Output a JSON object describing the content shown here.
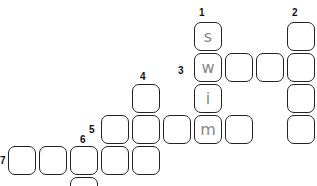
{
  "puzzle": {
    "numbers": [
      {
        "n": "1",
        "x": 199,
        "y": 7
      },
      {
        "n": "2",
        "x": 292,
        "y": 7
      },
      {
        "n": "3",
        "x": 178,
        "y": 65
      },
      {
        "n": "4",
        "x": 140,
        "y": 71
      },
      {
        "n": "5",
        "x": 89,
        "y": 124
      },
      {
        "n": "6",
        "x": 80,
        "y": 134
      },
      {
        "n": "7",
        "x": 0,
        "y": 155
      }
    ],
    "cells": [
      {
        "col": 6,
        "row": 0,
        "letter": "s"
      },
      {
        "col": 9,
        "row": 0,
        "letter": ""
      },
      {
        "col": 6,
        "row": 1,
        "letter": "w"
      },
      {
        "col": 7,
        "row": 1,
        "letter": ""
      },
      {
        "col": 8,
        "row": 1,
        "letter": ""
      },
      {
        "col": 9,
        "row": 1,
        "letter": ""
      },
      {
        "col": 4,
        "row": 2,
        "letter": ""
      },
      {
        "col": 6,
        "row": 2,
        "letter": "i"
      },
      {
        "col": 9,
        "row": 2,
        "letter": ""
      },
      {
        "col": 3,
        "row": 3,
        "letter": ""
      },
      {
        "col": 4,
        "row": 3,
        "letter": ""
      },
      {
        "col": 5,
        "row": 3,
        "letter": ""
      },
      {
        "col": 6,
        "row": 3,
        "letter": "m"
      },
      {
        "col": 7,
        "row": 3,
        "letter": ""
      },
      {
        "col": 9,
        "row": 3,
        "letter": ""
      },
      {
        "col": 0,
        "row": 4,
        "letter": ""
      },
      {
        "col": 1,
        "row": 4,
        "letter": ""
      },
      {
        "col": 2,
        "row": 4,
        "letter": ""
      },
      {
        "col": 3,
        "row": 4,
        "letter": ""
      },
      {
        "col": 4,
        "row": 4,
        "letter": ""
      },
      {
        "col": 2,
        "row": 5,
        "letter": ""
      }
    ]
  }
}
